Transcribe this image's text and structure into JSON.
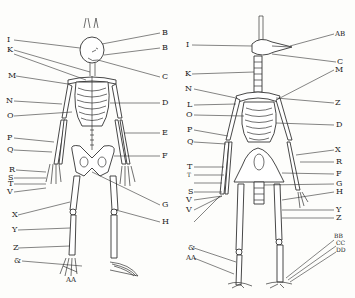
{
  "figure": {
    "title": "",
    "panels": [
      {
        "name": "human-skeleton",
        "labels_left": [
          "I",
          "K",
          "M",
          "N",
          "O",
          "P",
          "Q",
          "R",
          "S",
          "T",
          "V",
          "X",
          "Y",
          "Z",
          "&"
        ],
        "labels_right": [
          "B",
          "C",
          "D",
          "E",
          "F",
          "G",
          "H"
        ],
        "labels_bottom": [
          "AA"
        ]
      },
      {
        "name": "bird-skeleton",
        "labels_left": [
          "I",
          "K",
          "N",
          "L",
          "O",
          "P",
          "Q",
          "T",
          "T",
          "S",
          "V",
          "V",
          "&",
          "AA"
        ],
        "labels_right": [
          "AB",
          "C",
          "M",
          "Z",
          "D",
          "X",
          "R",
          "F",
          "G",
          "H",
          "Y",
          "Z",
          "BB",
          "CC",
          "DD"
        ]
      }
    ]
  },
  "human": {
    "I": "I",
    "K": "K",
    "M": "M",
    "N": "N",
    "O": "O",
    "P": "P",
    "Q": "Q",
    "R": "R",
    "S": "S",
    "T": "T",
    "V": "V",
    "X": "X",
    "Y": "Y",
    "Z": "Z",
    "amp": "&",
    "B": "B",
    "C": "C",
    "D": "D",
    "E": "E",
    "F": "F",
    "G": "G",
    "H": "H",
    "AA": "AA"
  },
  "bird": {
    "I": "I",
    "K": "K",
    "N": "N",
    "L": "L",
    "O": "O",
    "P": "P",
    "Q": "Q",
    "T1": "T",
    "T2": "T",
    "S": "S",
    "V1": "V",
    "V2": "V",
    "amp": "&",
    "AA": "AA",
    "AB": "AB",
    "C": "C",
    "M": "M",
    "Z1": "Z",
    "D": "D",
    "X": "X",
    "R": "R",
    "F": "F",
    "G": "G",
    "H": "H",
    "Y": "Y",
    "Z2": "Z",
    "BB": "BB",
    "CC": "CC",
    "DD": "DD"
  }
}
